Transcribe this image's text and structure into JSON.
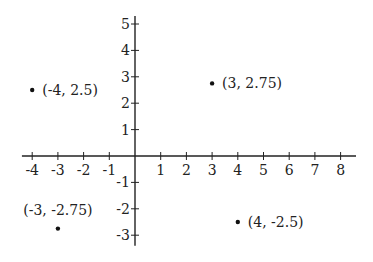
{
  "chart_data": {
    "type": "scatter",
    "title": "",
    "xlabel": "",
    "ylabel": "",
    "xlim": [
      -4.4,
      8.6
    ],
    "ylim": [
      -3.4,
      5.3
    ],
    "grid": false,
    "x_ticks": [
      -4,
      -3,
      -2,
      -1,
      1,
      2,
      3,
      4,
      5,
      6,
      7,
      8
    ],
    "y_ticks": [
      -3,
      -2,
      -1,
      1,
      2,
      3,
      4,
      5
    ],
    "points": [
      {
        "x": -4,
        "y": 2.5,
        "label": "(-4, 2.5)",
        "label_pos": "right"
      },
      {
        "x": 3,
        "y": 2.75,
        "label": "(3, 2.75)",
        "label_pos": "right"
      },
      {
        "x": -3,
        "y": -2.75,
        "label": "(-3, -2.75)",
        "label_pos": "above"
      },
      {
        "x": 4,
        "y": -2.5,
        "label": "(4, -2.5)",
        "label_pos": "right"
      }
    ],
    "colors": {
      "axis": "#222222",
      "point": "#111111",
      "background": "#ffffff"
    }
  }
}
